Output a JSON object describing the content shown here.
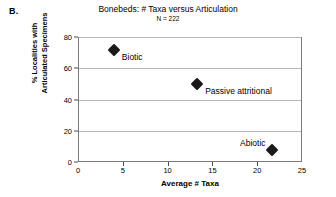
{
  "panel": {
    "label": "B."
  },
  "chart_data": {
    "type": "scatter",
    "title": "Bonebeds: # Taxa versus Articulation",
    "subtitle": "N = 222",
    "xlabel": "Average # Taxa",
    "ylabel_line1": "% Localities with",
    "ylabel_line2": "Articulated Specimens",
    "xlim": [
      0,
      25
    ],
    "ylim": [
      0,
      80
    ],
    "xticks": [
      0,
      5,
      10,
      15,
      20,
      25
    ],
    "yticks": [
      0,
      20,
      40,
      60,
      80
    ],
    "grid": "horizontal",
    "legend": "none",
    "marker_color": "#1a1a1a",
    "marker_shape": "diamond",
    "points": [
      {
        "label": "Biotic",
        "x": 4.0,
        "y": 72,
        "label_side": "right"
      },
      {
        "label": "Passive attritional",
        "x": 13.3,
        "y": 50,
        "label_side": "right"
      },
      {
        "label": "Abiotic",
        "x": 21.6,
        "y": 8,
        "label_side": "left"
      }
    ]
  }
}
